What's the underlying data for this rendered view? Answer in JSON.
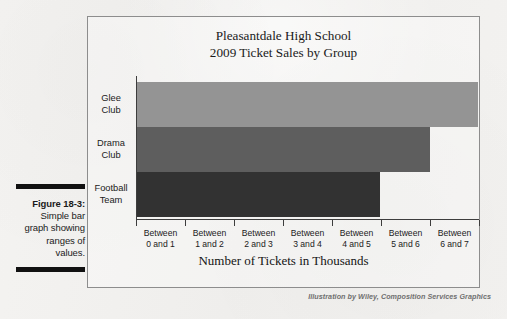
{
  "caption": {
    "figure_number": "Figure 18-3:",
    "description": "Simple bar graph showing ranges of values."
  },
  "credit": "Illustration by Wiley, Composition Services Graphics",
  "chart_data": {
    "type": "bar",
    "orientation": "horizontal",
    "title": "Pleasantdale High School\n2009 Ticket Sales by Group",
    "title_line1": "Pleasantdale High School",
    "title_line2": "2009 Ticket Sales by Group",
    "xlabel": "Number of Tickets in Thousands",
    "ylabel": "",
    "categories": [
      "Glee Club",
      "Drama Club",
      "Football Team"
    ],
    "category_lines": [
      [
        "Glee",
        "Club"
      ],
      [
        "Drama",
        "Club"
      ],
      [
        "Football",
        "Team"
      ]
    ],
    "values": [
      6.95,
      5.98,
      4.95
    ],
    "xlim": [
      0,
      7
    ],
    "xtick_labels": [
      [
        "Between",
        "0 and 1"
      ],
      [
        "Between",
        "1 and 2"
      ],
      [
        "Between",
        "2 and 3"
      ],
      [
        "Between",
        "3 and 4"
      ],
      [
        "Between",
        "4 and 5"
      ],
      [
        "Between",
        "5 and 6"
      ],
      [
        "Between",
        "6 and 7"
      ]
    ],
    "bar_colors": [
      "#949494",
      "#5e5e5e",
      "#323232"
    ],
    "grid": false,
    "legend": false
  }
}
